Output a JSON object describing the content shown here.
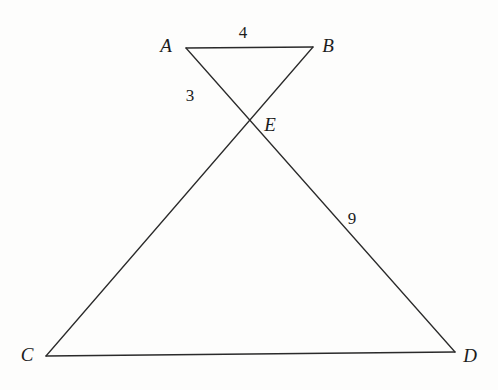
{
  "figure": {
    "kind": "geometry-diagram",
    "background_color": "#fdfdfc",
    "stroke_color": "#2a2a2a",
    "stroke_width": 1.3,
    "vertices": [
      {
        "id": "A",
        "label": "A",
        "x": 186,
        "y": 48,
        "label_x": 166,
        "label_y": 45
      },
      {
        "id": "B",
        "label": "B",
        "x": 313,
        "y": 47,
        "label_x": 328,
        "label_y": 45
      },
      {
        "id": "C",
        "label": "C",
        "x": 46,
        "y": 356,
        "label_x": 27,
        "label_y": 354
      },
      {
        "id": "D",
        "label": "D",
        "x": 455,
        "y": 352,
        "label_x": 470,
        "label_y": 355
      },
      {
        "id": "E",
        "label": "E",
        "x": 245,
        "y": 123,
        "label_x": 270,
        "label_y": 124
      }
    ],
    "segments": [
      {
        "id": "AB",
        "from": "A",
        "to": "B"
      },
      {
        "id": "CD",
        "from": "C",
        "to": "D"
      },
      {
        "id": "AD",
        "from": "A",
        "to": "D"
      },
      {
        "id": "BC",
        "from": "B",
        "to": "C"
      }
    ],
    "length_labels": [
      {
        "id": "AB-length",
        "segment": "AB",
        "text": "4",
        "x": 243,
        "y": 32
      },
      {
        "id": "AE-length",
        "segment": "AE",
        "text": "3",
        "x": 190,
        "y": 95
      },
      {
        "id": "ED-length",
        "segment": "ED",
        "text": "9",
        "x": 352,
        "y": 218
      }
    ]
  }
}
